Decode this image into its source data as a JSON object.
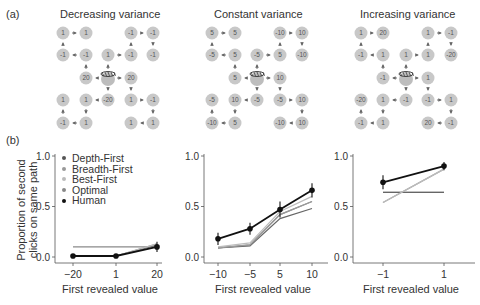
{
  "panel_labels": {
    "a": "(a)",
    "b": "(b)"
  },
  "trees": [
    {
      "title": "Decreasing variance",
      "cx": [
        63,
        86,
        108,
        131,
        153
      ],
      "nodes": [
        {
          "c": 0,
          "r": 0,
          "v": "1"
        },
        {
          "c": 1,
          "r": 0,
          "v": "1"
        },
        {
          "c": 3,
          "r": 0,
          "v": "-1"
        },
        {
          "c": 4,
          "r": 0,
          "v": "-1"
        },
        {
          "c": 0,
          "r": 1,
          "v": "-1"
        },
        {
          "c": 1,
          "r": 1,
          "v": "-1"
        },
        {
          "c": 2,
          "r": 1,
          "v": "1"
        },
        {
          "c": 3,
          "r": 1,
          "v": "-1"
        },
        {
          "c": 4,
          "r": 1,
          "v": "-1"
        },
        {
          "c": 1,
          "r": 2,
          "v": "20"
        },
        {
          "c": 3,
          "r": 2,
          "v": "20"
        },
        {
          "c": 0,
          "r": 3,
          "v": "1"
        },
        {
          "c": 1,
          "r": 3,
          "v": "1"
        },
        {
          "c": 2,
          "r": 3,
          "v": "-20"
        },
        {
          "c": 3,
          "r": 3,
          "v": "1"
        },
        {
          "c": 4,
          "r": 3,
          "v": "-1"
        },
        {
          "c": 0,
          "r": 4,
          "v": "-1"
        },
        {
          "c": 1,
          "r": 4,
          "v": "1"
        },
        {
          "c": 3,
          "r": 4,
          "v": "1"
        },
        {
          "c": 4,
          "r": 4,
          "v": "1"
        }
      ]
    },
    {
      "title": "Constant variance",
      "cx": [
        212,
        235,
        257,
        280,
        302
      ],
      "nodes": [
        {
          "c": 0,
          "r": 0,
          "v": "5"
        },
        {
          "c": 1,
          "r": 0,
          "v": "5"
        },
        {
          "c": 3,
          "r": 0,
          "v": "-10"
        },
        {
          "c": 4,
          "r": 0,
          "v": "10"
        },
        {
          "c": 0,
          "r": 1,
          "v": "-5"
        },
        {
          "c": 1,
          "r": 1,
          "v": "5"
        },
        {
          "c": 2,
          "r": 1,
          "v": "-5"
        },
        {
          "c": 3,
          "r": 1,
          "v": "5"
        },
        {
          "c": 4,
          "r": 1,
          "v": "-10"
        },
        {
          "c": 1,
          "r": 2,
          "v": "5"
        },
        {
          "c": 3,
          "r": 2,
          "v": "10"
        },
        {
          "c": 0,
          "r": 3,
          "v": "-5"
        },
        {
          "c": 1,
          "r": 3,
          "v": "10"
        },
        {
          "c": 2,
          "r": 3,
          "v": "-5"
        },
        {
          "c": 3,
          "r": 3,
          "v": "-5"
        },
        {
          "c": 4,
          "r": 3,
          "v": "10"
        },
        {
          "c": 0,
          "r": 4,
          "v": "-10"
        },
        {
          "c": 1,
          "r": 4,
          "v": "5"
        },
        {
          "c": 3,
          "r": 4,
          "v": "-10"
        },
        {
          "c": 4,
          "r": 4,
          "v": "10"
        }
      ]
    },
    {
      "title": "Increasing variance",
      "cx": [
        361,
        383,
        406,
        428,
        451
      ],
      "nodes": [
        {
          "c": 0,
          "r": 0,
          "v": "1"
        },
        {
          "c": 1,
          "r": 0,
          "v": "20"
        },
        {
          "c": 3,
          "r": 0,
          "v": "1"
        },
        {
          "c": 4,
          "r": 0,
          "v": "-1"
        },
        {
          "c": 0,
          "r": 1,
          "v": "-1"
        },
        {
          "c": 1,
          "r": 1,
          "v": "1"
        },
        {
          "c": 2,
          "r": 1,
          "v": "1"
        },
        {
          "c": 3,
          "r": 1,
          "v": "1"
        },
        {
          "c": 4,
          "r": 1,
          "v": "-20"
        },
        {
          "c": 1,
          "r": 2,
          "v": "-1"
        },
        {
          "c": 3,
          "r": 2,
          "v": "1"
        },
        {
          "c": 0,
          "r": 3,
          "v": "-20"
        },
        {
          "c": 1,
          "r": 3,
          "v": "1"
        },
        {
          "c": 2,
          "r": 3,
          "v": "-1"
        },
        {
          "c": 3,
          "r": 3,
          "v": "-1"
        },
        {
          "c": 4,
          "r": 3,
          "v": "1"
        },
        {
          "c": 0,
          "r": 4,
          "v": "-1"
        },
        {
          "c": 1,
          "r": 4,
          "v": "1"
        },
        {
          "c": 3,
          "r": 4,
          "v": "20"
        },
        {
          "c": 4,
          "r": 4,
          "v": "-1"
        }
      ]
    }
  ],
  "legend": [
    {
      "label": "Depth-First",
      "color": "#555555"
    },
    {
      "label": "Breadth-First",
      "color": "#999999"
    },
    {
      "label": "Best-First",
      "color": "#bbbbbb"
    },
    {
      "label": "Optimal",
      "color": "#888888"
    },
    {
      "label": "Human",
      "color": "#111111"
    }
  ],
  "axes": {
    "ylabel_line1": "Proportion of second",
    "ylabel_line2": "clicks on same path",
    "xlabel": "First revealed value",
    "yticks": [
      "0.0",
      "0.5",
      "1.0"
    ]
  },
  "chart_data": [
    {
      "type": "line",
      "title": "Decreasing variance",
      "xlabel": "First revealed value",
      "ylabel": "Proportion of second clicks on same path",
      "categories": [
        "-20",
        "1",
        "20"
      ],
      "ylim": [
        0,
        1
      ],
      "series": [
        {
          "name": "Depth-First",
          "values": [
            0.01,
            0.01,
            0.12
          ]
        },
        {
          "name": "Breadth-First",
          "values": [
            0.01,
            0.01,
            0.13
          ]
        },
        {
          "name": "Best-First",
          "values": [
            0.01,
            0.01,
            0.13
          ]
        },
        {
          "name": "Optimal",
          "values": [
            0.1,
            0.1,
            0.1
          ]
        },
        {
          "name": "Human",
          "values": [
            0.01,
            0.01,
            0.1
          ],
          "error": [
            0.01,
            0.01,
            0.05
          ]
        }
      ]
    },
    {
      "type": "line",
      "title": "Constant variance",
      "xlabel": "First revealed value",
      "ylabel": "Proportion of second clicks on same path",
      "categories": [
        "-10",
        "-5",
        "5",
        "10"
      ],
      "ylim": [
        0,
        1
      ],
      "series": [
        {
          "name": "Depth-First",
          "values": [
            0.09,
            0.11,
            0.38,
            0.48
          ]
        },
        {
          "name": "Breadth-First",
          "values": [
            0.09,
            0.12,
            0.42,
            0.55
          ]
        },
        {
          "name": "Best-First",
          "values": [
            0.1,
            0.14,
            0.45,
            0.6
          ]
        },
        {
          "name": "Optimal",
          "values": [
            0.09,
            0.12,
            0.42,
            0.55
          ]
        },
        {
          "name": "Human",
          "values": [
            0.18,
            0.28,
            0.47,
            0.66
          ],
          "error": [
            0.06,
            0.06,
            0.08,
            0.07
          ]
        }
      ]
    },
    {
      "type": "line",
      "title": "Increasing variance",
      "xlabel": "First revealed value",
      "ylabel": "Proportion of second clicks on same path",
      "categories": [
        "-1",
        "1"
      ],
      "ylim": [
        0,
        1
      ],
      "series": [
        {
          "name": "Depth-First",
          "values": [
            0.64,
            0.64
          ]
        },
        {
          "name": "Breadth-First",
          "values": [
            0.54,
            0.87
          ]
        },
        {
          "name": "Best-First",
          "values": [
            0.54,
            0.87
          ]
        },
        {
          "name": "Optimal",
          "values": [
            0.64,
            0.64
          ]
        },
        {
          "name": "Human",
          "values": [
            0.74,
            0.9
          ],
          "error": [
            0.07,
            0.04
          ]
        }
      ]
    }
  ]
}
